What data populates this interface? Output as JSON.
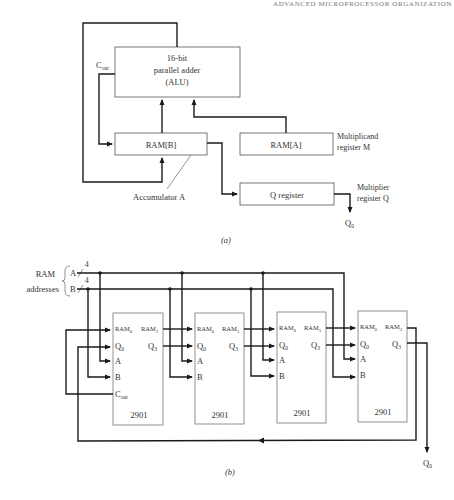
{
  "page": {
    "running_header": "ADVANCED MICROPROCESSOR ORGANIZATION"
  },
  "part_a": {
    "caption": "(a)",
    "alu": {
      "line1": "16-bit",
      "line2": "parallel adder",
      "line3": "(ALU)"
    },
    "cout_label": {
      "main": "C",
      "sub": "out"
    },
    "ram_b": "RAM[B]",
    "ram_a": "RAM[A]",
    "q_register": "Q register",
    "accumulator_label": "Accumulator A",
    "multiplicand_label": {
      "line1": "Multiplicand",
      "line2": "register M"
    },
    "multiplier_label": {
      "line1": "Multiplier",
      "line2": "register Q"
    },
    "q0_output": {
      "main": "Q",
      "sub": "0"
    }
  },
  "part_b": {
    "caption": "(b)",
    "ram_addresses_label": {
      "line1": "RAM",
      "line2": "addresses"
    },
    "bus_a": {
      "label": "A",
      "width": "4"
    },
    "bus_b": {
      "label": "B",
      "width": "4"
    },
    "chips": [
      {
        "name": "2901",
        "pins_left": [
          "RAM0",
          "Q0",
          "A",
          "B",
          "Cout"
        ],
        "pins_right": [
          "RAM3",
          "Q3"
        ]
      },
      {
        "name": "2901",
        "pins_left": [
          "RAM0",
          "Q0",
          "A",
          "B"
        ],
        "pins_right": [
          "RAM3",
          "Q3"
        ]
      },
      {
        "name": "2901",
        "pins_left": [
          "RAM0",
          "Q0",
          "A",
          "B"
        ],
        "pins_right": [
          "RAM3",
          "Q3"
        ]
      },
      {
        "name": "2901",
        "pins_left": [
          "RAM0",
          "Q0",
          "A",
          "B"
        ],
        "pins_right": [
          "RAM3",
          "Q3"
        ]
      }
    ],
    "pin_labels": {
      "ram0": {
        "main": "RAM",
        "sub": "0"
      },
      "ram3": {
        "main": "RAM",
        "sub": "3"
      },
      "q0": {
        "main": "Q",
        "sub": "0"
      },
      "q3": {
        "main": "Q",
        "sub": "3"
      },
      "a": "A",
      "b": "B",
      "cout": {
        "main": "C",
        "sub": "out"
      }
    },
    "q0_output": {
      "main": "Q",
      "sub": "0"
    }
  },
  "colors": {
    "line": "#1a1a1a",
    "box_border": "#555555",
    "text": "#333333",
    "background": "#ffffff"
  }
}
